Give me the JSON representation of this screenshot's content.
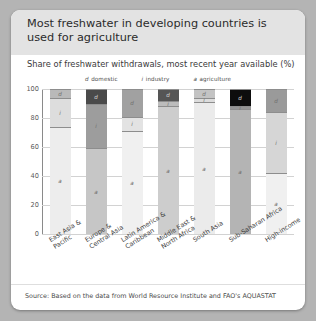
{
  "card": {
    "title": "Most freshwater in developing countries is used for agriculture",
    "subtitle": "Share of freshwater withdrawals, most recent year available (%)",
    "source": "Source: Based on the data from World Resource Institute and FAO's  AQUASTAT"
  },
  "legend": [
    {
      "key": "d",
      "label": "domestic",
      "color": "#6a6a6a"
    },
    {
      "key": "i",
      "label": "industry",
      "color": "#a8a8a8"
    },
    {
      "key": "a",
      "label": "agriculture",
      "color": "#ededed"
    }
  ],
  "chart_data": {
    "type": "bar",
    "subtype": "stacked-100",
    "title": "Most freshwater in developing countries is used for agriculture",
    "subtitle": "Share of freshwater withdrawals, most recent year available (%)",
    "xlabel": "",
    "ylabel": "",
    "ylim": [
      0,
      100
    ],
    "yticks": [
      0,
      20,
      40,
      60,
      80,
      100
    ],
    "grid": true,
    "legend_position": "top",
    "categories": [
      "East Asia &\nPacific",
      "Europe &\nCentral Asia",
      "Latin America &\nCaribbean",
      "Middle East &\nNorth Africa",
      "South Asia",
      "Sub-Saharan Africa",
      "High-income"
    ],
    "series": [
      {
        "name": "agriculture",
        "key": "a",
        "values": [
          74,
          59,
          71,
          88,
          91,
          86,
          42
        ]
      },
      {
        "name": "industry",
        "key": "i",
        "values": [
          20,
          31,
          10,
          4,
          3,
          2,
          42
        ]
      },
      {
        "name": "domestic",
        "key": "d",
        "values": [
          6,
          10,
          19,
          8,
          6,
          12,
          16
        ]
      }
    ],
    "bar_fills": {
      "agriculture": [
        "#ededed",
        "#c6c6c6",
        "#f0f0f0",
        "#cdcdcd",
        "#ebebeb",
        "#b4b4b4",
        "#f0f0f0"
      ],
      "industry": [
        "#dddddd",
        "#9d9d9d",
        "#e3e3e3",
        "#bcbcbc",
        "#dcdcdc",
        "#949494",
        "#d6d6d6"
      ],
      "domestic": [
        "#b9b9b9",
        "#4a4a4a",
        "#a1a1a1",
        "#555555",
        "#c3c3c3",
        "#0d0d0d",
        "#9a9a9a"
      ]
    }
  }
}
